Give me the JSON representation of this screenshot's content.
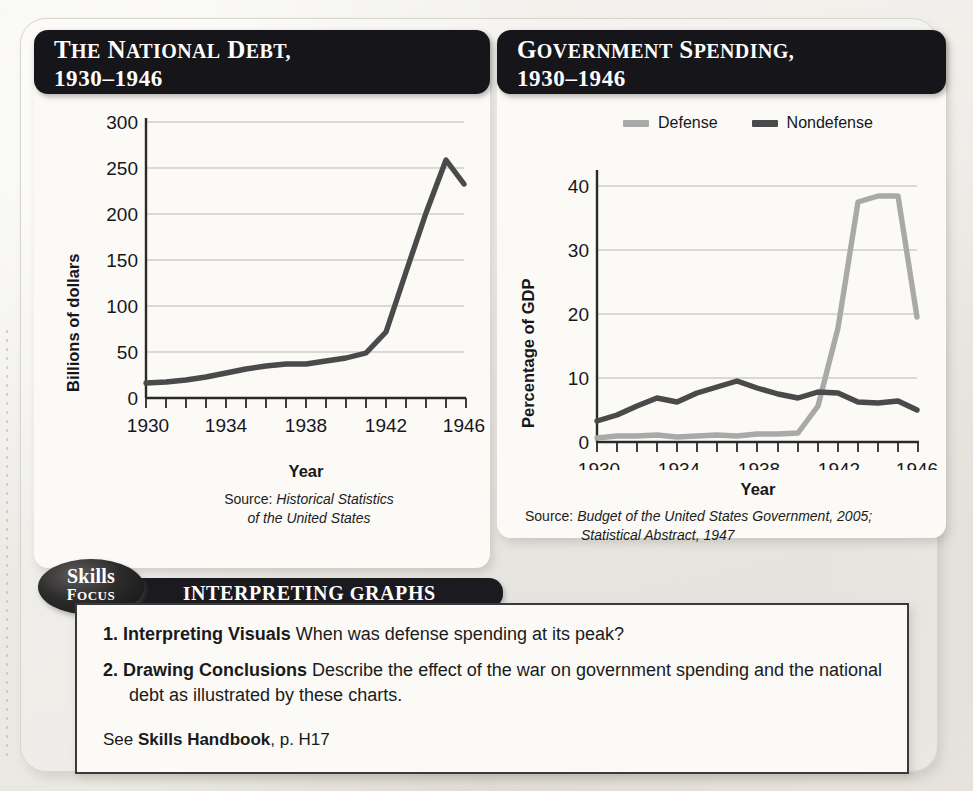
{
  "page": {
    "background_color": "#efeeea",
    "ghost_texts": [
      "Ghost Text",
      "WWII",
      "THE",
      "HOME"
    ]
  },
  "charts": [
    {
      "id": "national-debt",
      "title_line1": "The National Debt,",
      "title_line2": "1930–1946",
      "source_label": "Source:",
      "source_lines": [
        "Historical Statistics",
        "of the United States"
      ],
      "chart_data": {
        "type": "line",
        "title": "The National Debt, 1930–1946",
        "xlabel": "Year",
        "ylabel": "Billions of dollars",
        "xlim": [
          1930,
          1946
        ],
        "ylim": [
          0,
          300
        ],
        "ytick_values": [
          0,
          50,
          100,
          150,
          200,
          250,
          300
        ],
        "ytick_labels": [
          "0",
          "50",
          "100",
          "150",
          "200",
          "250",
          "300"
        ],
        "xtick_values": [
          1930,
          1934,
          1938,
          1942,
          1946
        ],
        "xtick_labels": [
          "1930",
          "1934",
          "1938",
          "1942",
          "1946"
        ],
        "minor_xticks_every": 1,
        "grid": "horizontal",
        "legend": false,
        "x": [
          1930,
          1931,
          1932,
          1933,
          1934,
          1935,
          1936,
          1937,
          1938,
          1939,
          1940,
          1941,
          1942,
          1943,
          1944,
          1945,
          1946
        ],
        "series": [
          {
            "name": "National debt",
            "color": "#4a4a4c",
            "values": [
              16,
              17,
              19,
              23,
              27,
              31,
              34,
              37,
              37,
              40,
              43,
              49,
              72,
              137,
              201,
              258,
              232
            ]
          }
        ]
      }
    },
    {
      "id": "government-spending",
      "title_line1": "Government Spending,",
      "title_line2": "1930–1946",
      "source_label": "Source:",
      "source_lines": [
        "Budget of the United States Government, 2005;",
        "Statistical Abstract, 1947"
      ],
      "chart_data": {
        "type": "line",
        "title": "Government Spending, 1930–1946",
        "xlabel": "Year",
        "ylabel": "Percentage of GDP",
        "xlim": [
          1930,
          1946
        ],
        "ylim": [
          0,
          42
        ],
        "ytick_values": [
          0,
          10,
          20,
          30,
          40
        ],
        "ytick_labels": [
          "0",
          "10",
          "20",
          "30",
          "40"
        ],
        "xtick_values": [
          1930,
          1934,
          1938,
          1942,
          1946
        ],
        "xtick_labels": [
          "1930",
          "1934",
          "1938",
          "1942",
          "1946"
        ],
        "minor_xticks_every": 1,
        "grid": "horizontal",
        "legend": true,
        "legend_position": "top",
        "x": [
          1930,
          1931,
          1932,
          1933,
          1934,
          1935,
          1936,
          1937,
          1938,
          1939,
          1940,
          1941,
          1942,
          1943,
          1944,
          1945,
          1946
        ],
        "series": [
          {
            "name": "Defense",
            "color": "#a9a9a9",
            "values": [
              0.7,
              0.9,
              1.0,
              1.1,
              0.8,
              1.0,
              1.1,
              1.0,
              1.3,
              1.2,
              1.4,
              5.6,
              17.8,
              37.5,
              38.5,
              38.4,
              19.5
            ]
          },
          {
            "name": "Nondefense",
            "color": "#4a4a4c",
            "values": [
              3.3,
              4.3,
              5.6,
              6.9,
              6.2,
              7.7,
              8.6,
              9.5,
              8.4,
              7.5,
              6.9,
              7.8,
              7.6,
              6.2,
              6.1,
              6.4,
              5.0
            ]
          }
        ]
      }
    }
  ],
  "skills": {
    "badge_line1": "Skills",
    "badge_line2": "Focus",
    "ribbon_label": "Interpreting Graphs"
  },
  "questions": [
    {
      "number": "1.",
      "term": "Interpreting Visuals",
      "text": "When was defense spending at its peak?"
    },
    {
      "number": "2.",
      "term": "Drawing Conclusions",
      "text": "Describe the effect of the war on government spending and the national debt as illustrated by these charts."
    }
  ],
  "footer": {
    "see_prefix": "See ",
    "see_link": "Skills Handbook",
    "see_suffix": ", p. H17"
  }
}
